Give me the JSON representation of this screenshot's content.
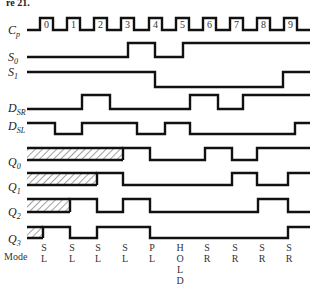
{
  "figure": {
    "title_fragment": "re 21.",
    "clock": {
      "label": "C",
      "subscript": "p",
      "pulse_numbers": [
        "0",
        "1",
        "2",
        "3",
        "4",
        "5",
        "6",
        "7",
        "8",
        "9"
      ],
      "rising_edges_x": [
        40,
        67,
        94,
        121,
        149,
        176,
        203,
        230,
        257,
        284
      ],
      "pulse_width": 13,
      "y_low": 30,
      "y_high": 18,
      "x_start": 27,
      "x_end": 310
    },
    "signals": [
      {
        "id": "S0",
        "label": "S",
        "subscript": "0",
        "label_y": 61,
        "y_low": 57,
        "y_high": 43,
        "points": [
          [
            27,
            "L"
          ],
          [
            128,
            "H"
          ],
          [
            155,
            "L"
          ],
          [
            183,
            "H"
          ],
          [
            310,
            "H"
          ]
        ]
      },
      {
        "id": "S1",
        "label": "S",
        "subscript": "1",
        "label_y": 76,
        "y_low": 87,
        "y_high": 72,
        "points": [
          [
            27,
            "H"
          ],
          [
            155,
            "L"
          ],
          [
            283,
            "H"
          ],
          [
            310,
            "H"
          ]
        ]
      },
      {
        "id": "DSR",
        "label": "D",
        "subscript": "SR",
        "label_y": 112,
        "y_low": 109,
        "y_high": 95,
        "points": [
          [
            27,
            "L"
          ],
          [
            82,
            "H"
          ],
          [
            110,
            "L"
          ],
          [
            190,
            "H"
          ],
          [
            218,
            "L"
          ],
          [
            243,
            "H"
          ],
          [
            310,
            "H"
          ]
        ]
      },
      {
        "id": "DSL",
        "label": "D",
        "subscript": "SL",
        "label_y": 130,
        "y_low": 134,
        "y_high": 123,
        "points": [
          [
            27,
            "H"
          ],
          [
            55,
            "L"
          ],
          [
            82,
            "H"
          ],
          [
            137,
            "L"
          ],
          [
            165,
            "H"
          ],
          [
            190,
            "L"
          ],
          [
            295,
            "H"
          ],
          [
            310,
            "H"
          ]
        ]
      },
      {
        "id": "Q0",
        "label": "Q",
        "subscript": "0",
        "label_y": 166,
        "y_low": 160,
        "y_high": 148,
        "hatch_end": 123,
        "points": [
          [
            123,
            "H"
          ],
          [
            150,
            "L"
          ],
          [
            205,
            "H"
          ],
          [
            232,
            "L"
          ],
          [
            257,
            "H"
          ],
          [
            310,
            "H"
          ]
        ]
      },
      {
        "id": "Q1",
        "label": "Q",
        "subscript": "1",
        "label_y": 191,
        "y_low": 185,
        "y_high": 173,
        "hatch_end": 97,
        "points": [
          [
            97,
            "H"
          ],
          [
            123,
            "L"
          ],
          [
            232,
            "H"
          ],
          [
            257,
            "L"
          ],
          [
            288,
            "H"
          ],
          [
            310,
            "H"
          ]
        ]
      },
      {
        "id": "Q2",
        "label": "Q",
        "subscript": "2",
        "label_y": 216,
        "y_low": 212,
        "y_high": 199,
        "hatch_end": 70,
        "points": [
          [
            70,
            "H"
          ],
          [
            97,
            "L"
          ],
          [
            123,
            "H"
          ],
          [
            150,
            "L"
          ],
          [
            258,
            "H"
          ],
          [
            288,
            "L"
          ],
          [
            310,
            "L"
          ]
        ]
      },
      {
        "id": "Q3",
        "label": "Q",
        "subscript": "3",
        "label_y": 243,
        "y_low": 238,
        "y_high": 227,
        "hatch_end": 43,
        "points": [
          [
            43,
            "H"
          ],
          [
            70,
            "L"
          ],
          [
            97,
            "H"
          ],
          [
            150,
            "L"
          ],
          [
            288,
            "H"
          ],
          [
            310,
            "H"
          ]
        ]
      }
    ],
    "mode": {
      "label": "Mode",
      "columns": [
        {
          "x": 44,
          "text": [
            "S",
            "L"
          ]
        },
        {
          "x": 72,
          "text": [
            "S",
            "L"
          ]
        },
        {
          "x": 98,
          "text": [
            "S",
            "L"
          ]
        },
        {
          "x": 125,
          "text": [
            "S",
            "L"
          ]
        },
        {
          "x": 152,
          "text": [
            "P",
            "L"
          ]
        },
        {
          "x": 180,
          "text": [
            "H",
            "O",
            "L",
            "D"
          ]
        },
        {
          "x": 207,
          "text": [
            "S",
            "R"
          ]
        },
        {
          "x": 235,
          "text": [
            "S",
            "R"
          ]
        },
        {
          "x": 262,
          "text": [
            "S",
            "R"
          ]
        },
        {
          "x": 289,
          "text": [
            "S",
            "R"
          ]
        }
      ]
    }
  }
}
